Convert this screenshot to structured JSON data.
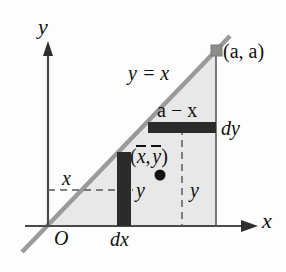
{
  "figure": {
    "axes": {
      "y_label": "y",
      "x_label": "x",
      "origin_label": "O"
    },
    "labels": {
      "line_equation": "y = x",
      "vertex_point": "(a, a)",
      "horizontal_strip_length": "a − x",
      "horizontal_strip_thickness": "dy",
      "vertical_strip_thickness": "dx",
      "x_distance": "x",
      "vertical_strip_height": "y",
      "horizontal_strip_height": "y",
      "centroid": "(x̄, ȳ)"
    },
    "colors": {
      "region_fill": "#e8e8e8",
      "line_stroke": "#9a9a9a",
      "axis_stroke": "#4a4a4a",
      "strip_fill": "#2b2b2b",
      "marker_fill": "#8c8c8c",
      "dot_fill": "#111111",
      "dashed_stroke": "#555555",
      "background": "#fdfdfd"
    },
    "geometry": {
      "origin_px": [
        48,
        226
      ],
      "vertex_px": [
        216,
        50
      ],
      "x_axis_end_px": [
        258,
        226
      ],
      "y_axis_top_px": [
        48,
        45
      ],
      "line_start_px": [
        22,
        252
      ],
      "line_end_px": [
        230,
        36
      ],
      "vertical_strip_px": [
        117,
        152,
        14,
        74
      ],
      "horizontal_strip_px": [
        148,
        122,
        68,
        11
      ],
      "centroid_dot_px": [
        160,
        175
      ],
      "dashed_horizontal_y_px": 190,
      "dashed_vertical_x_px": 182
    }
  }
}
